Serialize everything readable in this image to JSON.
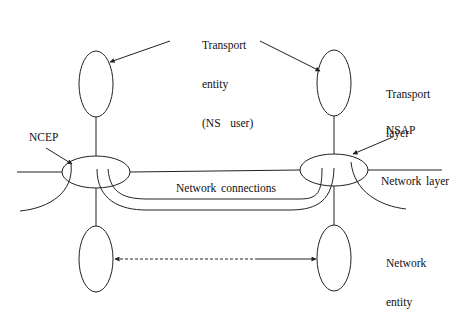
{
  "diagram": {
    "labels": {
      "transport_entity": [
        "Transport",
        "entity",
        "(NS  user)"
      ],
      "transport_layer": [
        "Transport",
        "layer"
      ],
      "ncep": "NCEP",
      "nsap": "NSAP",
      "network_connections": "Network connections",
      "network_layer": "Network layer",
      "network_entity": [
        "Network",
        "entity"
      ]
    },
    "nodes": [
      {
        "id": "transport-entity-left",
        "shape": "ellipse",
        "cx": 96,
        "cy": 84,
        "rx": 17,
        "ry": 33
      },
      {
        "id": "transport-entity-right",
        "shape": "ellipse",
        "cx": 334,
        "cy": 83,
        "rx": 17,
        "ry": 33
      },
      {
        "id": "ncep-left",
        "shape": "ellipse",
        "cx": 96,
        "cy": 172,
        "rx": 34,
        "ry": 16
      },
      {
        "id": "nsap-right",
        "shape": "ellipse",
        "cx": 334,
        "cy": 170,
        "rx": 34,
        "ry": 16
      },
      {
        "id": "network-entity-left",
        "shape": "ellipse",
        "cx": 96,
        "cy": 259,
        "rx": 17,
        "ry": 33
      },
      {
        "id": "network-entity-right",
        "shape": "ellipse",
        "cx": 334,
        "cy": 258,
        "rx": 17,
        "ry": 33
      }
    ],
    "edges": [
      {
        "from": "transport-entity-left",
        "to": "ncep-left",
        "style": "solid"
      },
      {
        "from": "transport-entity-right",
        "to": "nsap-right",
        "style": "solid"
      },
      {
        "from": "ncep-left",
        "to": "network-entity-left",
        "style": "solid"
      },
      {
        "from": "nsap-right",
        "to": "network-entity-right",
        "style": "solid"
      },
      {
        "from": "network-entity-left",
        "to": "network-entity-right",
        "style": "dashed-then-solid",
        "arrows": "both"
      },
      {
        "from": "ncep-left",
        "to": "nsap-right",
        "label": "Network connections",
        "count": 3
      }
    ],
    "colors": {
      "stroke": "#222222",
      "background": "#ffffff",
      "text": "#111111"
    }
  }
}
